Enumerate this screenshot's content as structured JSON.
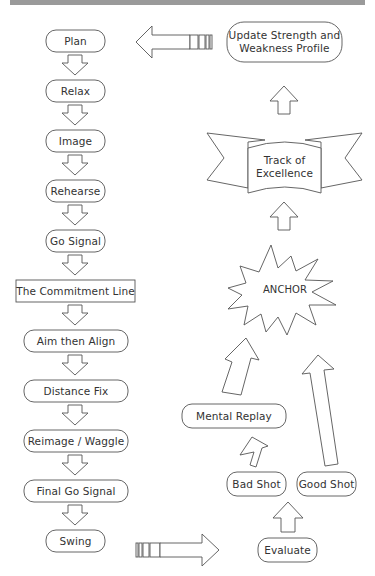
{
  "diagram": {
    "left_column": [
      {
        "id": "plan",
        "label": "Plan"
      },
      {
        "id": "relax",
        "label": "Relax"
      },
      {
        "id": "image",
        "label": "Image"
      },
      {
        "id": "rehearse",
        "label": "Rehearse"
      },
      {
        "id": "go-signal",
        "label": "Go Signal"
      },
      {
        "id": "commitment-line",
        "label": "The Commitment Line"
      },
      {
        "id": "aim-then-align",
        "label": "Aim then Align"
      },
      {
        "id": "distance-fix",
        "label": "Distance Fix"
      },
      {
        "id": "reimage-waggle",
        "label": "Reimage / Waggle"
      },
      {
        "id": "final-go-signal",
        "label": "Final Go Signal"
      },
      {
        "id": "swing",
        "label": "Swing"
      }
    ],
    "right_column": {
      "update": "Update Strength and Weakness Profile",
      "update_line1": "Update Strength and",
      "update_line2": "Weakness Profile",
      "track": "Track of Excellence",
      "track_line1": "Track of",
      "track_line2": "Excellence",
      "anchor": "ANCHOR",
      "mental_replay": "Mental Replay",
      "bad_shot": "Bad Shot",
      "good_shot": "Good Shot",
      "evaluate": "Evaluate"
    },
    "colors": {
      "stroke": "#555555",
      "text": "#333333",
      "background": "#ffffff",
      "top_band": "#9a9a9a"
    }
  }
}
